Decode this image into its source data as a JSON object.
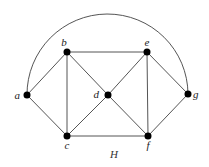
{
  "graph": {
    "title": "H",
    "nodes": [
      {
        "id": "a",
        "label": "a"
      },
      {
        "id": "b",
        "label": "b"
      },
      {
        "id": "c",
        "label": "c"
      },
      {
        "id": "d",
        "label": "d"
      },
      {
        "id": "e",
        "label": "e"
      },
      {
        "id": "f",
        "label": "f"
      },
      {
        "id": "g",
        "label": "g"
      }
    ],
    "edges": [
      [
        "a",
        "b"
      ],
      [
        "a",
        "c"
      ],
      [
        "a",
        "g"
      ],
      [
        "b",
        "c"
      ],
      [
        "b",
        "d"
      ],
      [
        "b",
        "e"
      ],
      [
        "c",
        "d"
      ],
      [
        "c",
        "f"
      ],
      [
        "d",
        "e"
      ],
      [
        "d",
        "f"
      ],
      [
        "e",
        "f"
      ],
      [
        "e",
        "g"
      ],
      [
        "f",
        "g"
      ]
    ],
    "curved_edges": [
      [
        "a",
        "g"
      ]
    ]
  }
}
